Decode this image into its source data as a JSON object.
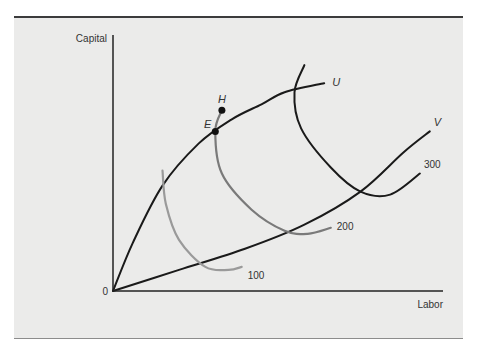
{
  "chart_data": {
    "type": "line",
    "title": "",
    "xlabel": "Labor",
    "ylabel": "Capital",
    "origin_label": "0",
    "xlim": [
      0,
      10
    ],
    "ylim": [
      0,
      8.5
    ],
    "grid": false,
    "legend": "none",
    "series": [
      {
        "name": "U",
        "kind": "expansion-path",
        "color": "#1a1a1a",
        "points": [
          [
            0,
            0
          ],
          [
            0.6,
            1.6
          ],
          [
            1.5,
            3.5
          ],
          [
            2.6,
            4.9
          ],
          [
            3.6,
            5.7
          ],
          [
            4.5,
            6.2
          ],
          [
            5.2,
            6.6
          ],
          [
            6.4,
            6.9
          ]
        ]
      },
      {
        "name": "V",
        "kind": "expansion-path",
        "color": "#1a1a1a",
        "points": [
          [
            0,
            0
          ],
          [
            2.0,
            0.7
          ],
          [
            4.0,
            1.4
          ],
          [
            5.8,
            2.2
          ],
          [
            7.5,
            3.3
          ],
          [
            8.8,
            4.6
          ],
          [
            9.6,
            5.3
          ]
        ]
      },
      {
        "name": "100",
        "kind": "isoquant",
        "color": "#9a9a9a",
        "points": [
          [
            1.5,
            4.0
          ],
          [
            1.6,
            2.9
          ],
          [
            2.0,
            1.7
          ],
          [
            2.8,
            0.8
          ],
          [
            3.5,
            0.7
          ],
          [
            3.9,
            0.8
          ]
        ]
      },
      {
        "name": "200",
        "kind": "isoquant",
        "color": "#7a7a7a",
        "points": [
          [
            3.3,
            6.0
          ],
          [
            3.1,
            5.3
          ],
          [
            3.3,
            3.9
          ],
          [
            4.2,
            2.7
          ],
          [
            5.2,
            2.0
          ],
          [
            5.9,
            1.9
          ],
          [
            6.6,
            2.1
          ]
        ]
      },
      {
        "name": "300",
        "kind": "isoquant",
        "color": "#1a1a1a",
        "points": [
          [
            5.8,
            7.5
          ],
          [
            5.5,
            6.6
          ],
          [
            5.7,
            5.4
          ],
          [
            6.6,
            4.1
          ],
          [
            7.5,
            3.3
          ],
          [
            8.4,
            3.2
          ],
          [
            9.3,
            3.9
          ]
        ]
      }
    ],
    "points": [
      {
        "label": "E",
        "x": 3.1,
        "y": 5.3
      },
      {
        "label": "H",
        "x": 3.3,
        "y": 6.0
      }
    ],
    "annotations": [
      {
        "text": "U",
        "at_series": "U"
      },
      {
        "text": "V",
        "at_series": "V"
      },
      {
        "text": "100",
        "at_series": "100"
      },
      {
        "text": "200",
        "at_series": "200"
      },
      {
        "text": "300",
        "at_series": "300"
      }
    ]
  }
}
